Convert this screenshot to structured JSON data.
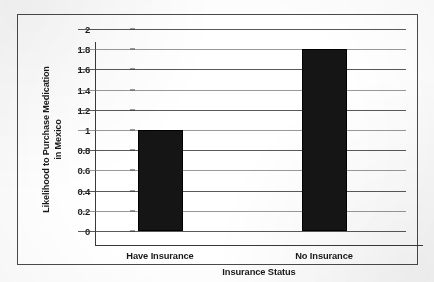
{
  "chart_data": {
    "type": "bar",
    "title": "",
    "categories": [
      "Have Insurance",
      "No Insurance"
    ],
    "values": [
      1.0,
      1.8
    ],
    "xlabel": "Insurance Status",
    "ylabel": "Likelihood to Purchase Medication in Mexico",
    "ylabel_line1": "Likelihood to Purchase Medication",
    "ylabel_line2": "in Mexico",
    "ylim": [
      0,
      2
    ],
    "ytick_step": 0.2,
    "ytick_labels": [
      "0",
      "0.2",
      "0.4",
      "0.6",
      "0.8",
      "1",
      "1.2",
      "1.4",
      "1.6",
      "1.8",
      "2"
    ],
    "ytick_values": [
      0,
      0.2,
      0.4,
      0.6,
      0.8,
      1,
      1.2,
      1.4,
      1.6,
      1.8,
      2
    ],
    "grid": true,
    "grid_axis": "y",
    "legend": false,
    "legend_position": "none",
    "bar_color": "#151515",
    "grid_color": "#3c3c3c",
    "axis_color": "#3a3a3a",
    "frame_color": "#4a4a4a",
    "background_color": "#ffffff"
  }
}
